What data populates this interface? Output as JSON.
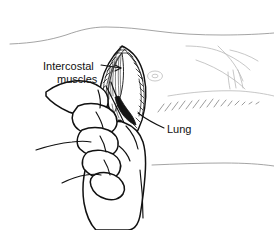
{
  "figure": {
    "background_color": "#ffffff",
    "ink_color": "#111111",
    "contour_color": "#9a9a9a"
  },
  "labels": [
    {
      "id": "intercostal-muscles",
      "line1": "Intercostal",
      "line2": "muscles",
      "x": 43,
      "y": 71,
      "leader": "from text right edge to incision interior, with arrowhead"
    },
    {
      "id": "lung",
      "line1": "Lung",
      "line2": "",
      "x": 167,
      "y": 131,
      "leader": "from text left edge up-left to dark cavity"
    }
  ],
  "anatomy": {
    "incision_label": "intercostal incision",
    "cavity_label": "pleural cavity",
    "hand_label": "surgeon hand"
  }
}
